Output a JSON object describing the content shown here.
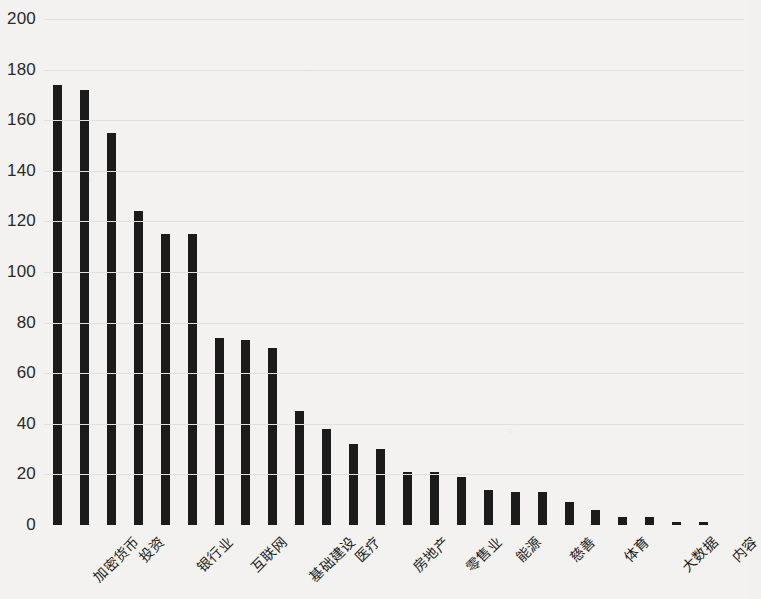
{
  "chart_data": {
    "type": "bar",
    "title": "",
    "subtitle": "",
    "xlabel": "",
    "ylabel": "",
    "ylim": [
      0,
      200
    ],
    "yticks": [
      0,
      20,
      40,
      60,
      80,
      100,
      120,
      140,
      160,
      180,
      200
    ],
    "grid": true,
    "legend": null,
    "bar_color": "#1b1b1b",
    "background_color": "#f3f2f0",
    "label_rotation": -45,
    "labels_on_alternating_bars": true,
    "categories": [
      "加密货币",
      "",
      "投资",
      "",
      "银行业",
      "",
      "互联网",
      "",
      "基础建设",
      "",
      "医疗",
      "",
      "房地产",
      "",
      "零售业",
      "",
      "能源",
      "",
      "慈善",
      "",
      "体育",
      "",
      "大数据",
      "",
      "内容",
      ""
    ],
    "visible_tick_labels": [
      "加密货币",
      "投资",
      "银行业",
      "互联网",
      "基础建设",
      "医疗",
      "房地产",
      "零售业",
      "能源",
      "慈善",
      "体育",
      "大数据",
      "内容"
    ],
    "values": [
      174,
      172,
      155,
      124,
      115,
      115,
      74,
      73,
      70,
      45,
      38,
      32,
      30,
      21,
      21,
      19,
      14,
      13,
      13,
      9,
      6,
      3,
      3,
      1,
      1,
      0
    ]
  }
}
